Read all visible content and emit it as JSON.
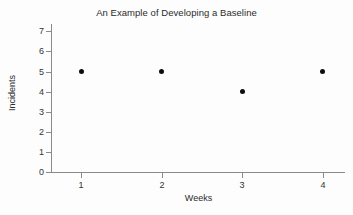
{
  "chart_data": {
    "type": "scatter",
    "title": "An Example of Developing a Baseline",
    "xlabel": "Weeks",
    "ylabel": "Incidents",
    "x": [
      1,
      2,
      3,
      4
    ],
    "values": [
      5,
      5,
      4,
      5
    ],
    "categories": [
      "1",
      "2",
      "3",
      "4"
    ],
    "xtick_labels": [
      "1",
      "2",
      "3",
      "4"
    ],
    "ytick_labels": [
      "0",
      "1",
      "2",
      "3",
      "4",
      "5",
      "6",
      "7"
    ],
    "yticks": [
      0,
      1,
      2,
      3,
      4,
      5,
      6,
      7
    ],
    "xlim": [
      0.5,
      4.5
    ],
    "ylim": [
      0,
      7
    ],
    "grid": false,
    "legend": null,
    "marker_color": "#0d0d0d",
    "axis_color": "#8a8a8a",
    "background_color": "#fdfdfd"
  }
}
